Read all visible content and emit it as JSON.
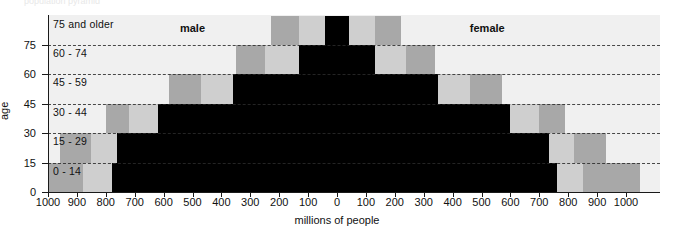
{
  "figure": {
    "clipped_header_text": "population pyramid",
    "background_color": "#ffffff",
    "plot_background_color": "#f0f0f0"
  },
  "colors": {
    "current": "#000000",
    "band_mid": "#a8a8a8",
    "band_light": "#cfcfcf",
    "band_pale": "#e3e3e3",
    "plot_bg": "#f0f0f0",
    "axis": "#1a1a1a",
    "gridline": "#2b2b2b"
  },
  "series_labels": {
    "left": "male",
    "right": "female"
  },
  "axes": {
    "x_title": "millions of people",
    "y_title": "age",
    "x_tick_labels": [
      "1000",
      "900",
      "800",
      "700",
      "600",
      "500",
      "400",
      "300",
      "200",
      "100",
      "0",
      "100",
      "200",
      "300",
      "400",
      "500",
      "600",
      "700",
      "800",
      "900",
      "1000"
    ],
    "x_tick_values": [
      -1000,
      -900,
      -800,
      -700,
      -600,
      -500,
      -400,
      -300,
      -200,
      -100,
      0,
      100,
      200,
      300,
      400,
      500,
      600,
      700,
      800,
      900,
      1000
    ],
    "y_tick_labels": [
      "0",
      "15",
      "30",
      "45",
      "60",
      "75"
    ],
    "y_tick_values": [
      0,
      15,
      30,
      45,
      60,
      75
    ],
    "xlim": [
      -1050,
      1050
    ],
    "ylim": [
      0,
      90
    ],
    "grid": "dashed-horizontal"
  },
  "age_groups": [
    {
      "label": "0 - 14",
      "y_bottom": 0,
      "y_top": 15
    },
    {
      "label": "15 - 29",
      "y_bottom": 15,
      "y_top": 30
    },
    {
      "label": "30 - 44",
      "y_bottom": 30,
      "y_top": 45
    },
    {
      "label": "45 - 59",
      "y_bottom": 45,
      "y_top": 60
    },
    {
      "label": "60 - 74",
      "y_bottom": 60,
      "y_top": 75
    },
    {
      "label": "75 and older",
      "y_bottom": 75,
      "y_top": 90
    }
  ],
  "chart_data": {
    "type": "bar",
    "title": "",
    "subtitle": "",
    "xlabel": "millions of people",
    "ylabel": "age",
    "orientation": "horizontal-diverging",
    "categories": [
      "0 - 14",
      "15 - 29",
      "30 - 44",
      "45 - 59",
      "60 - 74",
      "75 and older"
    ],
    "xlim": [
      -1050,
      1050
    ],
    "x_tick_labels": [
      "1000",
      "900",
      "800",
      "700",
      "600",
      "500",
      "400",
      "300",
      "200",
      "100",
      "0",
      "100",
      "200",
      "300",
      "400",
      "500",
      "600",
      "700",
      "800",
      "900",
      "1000"
    ],
    "grid": true,
    "legend": "in-plot text labels: male (left side), female (right side)",
    "series": [
      {
        "name": "male current (black)",
        "color": "#000000",
        "units": "millions of people",
        "side": "left",
        "values": [
          780,
          760,
          620,
          360,
          130,
          40
        ]
      },
      {
        "name": "female current (black)",
        "color": "#000000",
        "units": "millions of people",
        "side": "right",
        "values": [
          760,
          735,
          600,
          350,
          130,
          40
        ]
      },
      {
        "name": "male band light (inner projection)",
        "color": "#cfcfcf",
        "side": "left",
        "values": [
          880,
          850,
          720,
          470,
          250,
          130
        ]
      },
      {
        "name": "female band light (inner projection)",
        "color": "#cfcfcf",
        "side": "right",
        "values": [
          850,
          820,
          700,
          460,
          240,
          130
        ]
      },
      {
        "name": "male band mid (outer projection)",
        "color": "#a8a8a8",
        "side": "left",
        "values": [
          1050,
          960,
          800,
          580,
          350,
          230
        ]
      },
      {
        "name": "female band mid (outer projection)",
        "color": "#a8a8a8",
        "side": "right",
        "values": [
          1050,
          930,
          790,
          570,
          340,
          220
        ]
      }
    ]
  }
}
